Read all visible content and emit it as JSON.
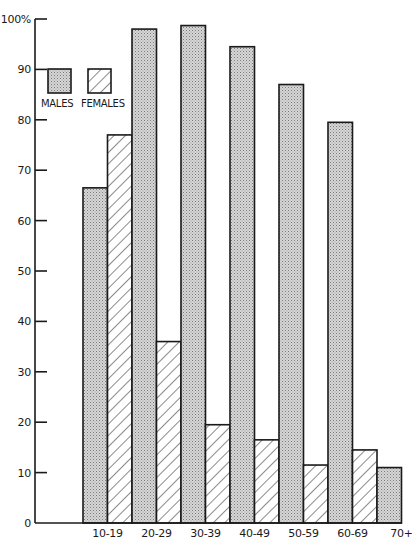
{
  "chart_data": {
    "type": "bar",
    "title": "",
    "xlabel": "",
    "ylabel": "",
    "ylim": [
      0,
      100
    ],
    "y_ticks": [
      0,
      10,
      20,
      30,
      40,
      50,
      60,
      70,
      80,
      90,
      100
    ],
    "y_tick_labels": [
      "0",
      "10",
      "20",
      "30",
      "40",
      "50",
      "60",
      "70",
      "80",
      "90",
      "100%"
    ],
    "grid": false,
    "legend_position": "upper-left",
    "categories": [
      "10-19",
      "20-29",
      "30-39",
      "40-49",
      "50-59",
      "60-69",
      "70+"
    ],
    "series": [
      {
        "name": "MALES",
        "pattern": "dotted-gray",
        "values": [
          66.5,
          98,
          98.7,
          94.5,
          87,
          79.5,
          11
        ]
      },
      {
        "name": "FEMALES",
        "pattern": "diagonal-hatch",
        "values": [
          77,
          36,
          19.5,
          16.5,
          11.5,
          14.5,
          null
        ]
      }
    ]
  },
  "legend": {
    "males_label": "MALES",
    "females_label": "FEMALES"
  },
  "colors": {
    "axis": "#1a1a1a",
    "bar_outline": "#1a1a1a",
    "male_fill": "#bdbdbd",
    "female_fill": "#ffffff"
  }
}
